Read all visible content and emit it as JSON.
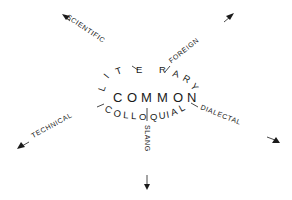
{
  "diagram": {
    "center_word": "COMMON",
    "upper_arc_word": "LITERARY",
    "lower_arc_word": "COLLOQUIAL",
    "rays": {
      "upper_left": "SCIENTIFIC",
      "upper_right": "FOREIGN",
      "lower_left": "TECHNICAL",
      "lower_right": "DIALECTAL",
      "bottom": "SLANG"
    },
    "center_letters": [
      "C",
      "O",
      "M",
      "M",
      "O",
      "N"
    ],
    "upper_arc_letters": [
      "L",
      "I",
      "T",
      "E",
      "R",
      "A",
      "R",
      "Y"
    ],
    "lower_arc_letters": [
      "C",
      "O",
      "L",
      "L",
      "O",
      "Q",
      "U",
      "I",
      "A",
      "L"
    ]
  }
}
